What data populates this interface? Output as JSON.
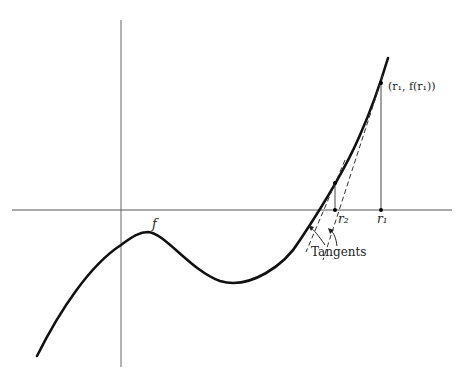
{
  "diagram": {
    "function_label": "f",
    "point_label": "(r₁, f(r₁))",
    "root_labels": {
      "r2": "r₂",
      "r1": "r₁"
    },
    "annotation": "Tangents",
    "colors": {
      "curve": "#111111",
      "axis": "#555555",
      "tangent": "#333333"
    }
  }
}
